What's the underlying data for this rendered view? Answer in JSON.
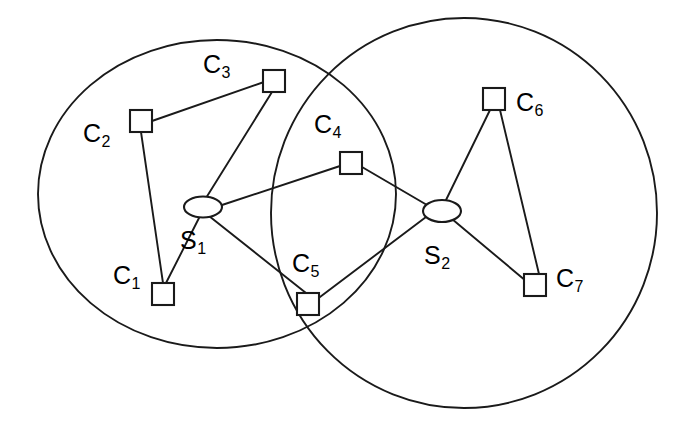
{
  "figure": {
    "background_color": "#ffffff",
    "stroke_color": "#1a1a1a",
    "width": 689,
    "height": 430
  },
  "clusters": [
    {
      "id": "cluster-1",
      "name": "left-cluster",
      "shape": "ellipse",
      "cx": 217,
      "cy": 194,
      "rx": 179,
      "ry": 154
    },
    {
      "id": "cluster-2",
      "name": "right-cluster",
      "shape": "circle",
      "cx": 464,
      "cy": 213,
      "rx": 193,
      "ry": 195
    }
  ],
  "servers": [
    {
      "id": "S1",
      "label": "S",
      "subscript": "1",
      "shape": "ellipse",
      "cx": 203,
      "cy": 207,
      "rx": 19,
      "ry": 10.5,
      "label_x": 180,
      "label_y": 228
    },
    {
      "id": "S2",
      "label": "S",
      "subscript": "2",
      "shape": "ellipse",
      "cx": 442,
      "cy": 211,
      "rx": 19,
      "ry": 11,
      "label_x": 424,
      "label_y": 243
    }
  ],
  "clients": [
    {
      "id": "C1",
      "label": "C",
      "subscript": "1",
      "shape": "square",
      "x": 152,
      "y": 283,
      "size": 22,
      "label_x": 113,
      "label_y": 263
    },
    {
      "id": "C2",
      "label": "C",
      "subscript": "2",
      "shape": "square",
      "x": 130,
      "y": 110,
      "size": 22,
      "label_x": 83,
      "label_y": 121
    },
    {
      "id": "C3",
      "label": "C",
      "subscript": "3",
      "shape": "square",
      "x": 263,
      "y": 70,
      "size": 22,
      "label_x": 203,
      "label_y": 52
    },
    {
      "id": "C4",
      "label": "C",
      "subscript": "4",
      "shape": "square",
      "x": 340,
      "y": 152,
      "size": 22,
      "label_x": 314,
      "label_y": 112
    },
    {
      "id": "C5",
      "label": "C",
      "subscript": "5",
      "shape": "square",
      "x": 297,
      "y": 293,
      "size": 22,
      "label_x": 292,
      "label_y": 251
    },
    {
      "id": "C6",
      "label": "C",
      "subscript": "6",
      "shape": "square",
      "x": 483,
      "y": 88,
      "size": 22,
      "label_x": 516,
      "label_y": 90
    },
    {
      "id": "C7",
      "label": "C",
      "subscript": "7",
      "shape": "square",
      "x": 524,
      "y": 274,
      "size": 22,
      "label_x": 556,
      "label_y": 266
    }
  ],
  "edges": [
    {
      "id": "e-C2-C3",
      "from": "C2",
      "to": "C3",
      "x1": 152,
      "y1": 121,
      "x2": 264,
      "y2": 82
    },
    {
      "id": "e-C2-C1",
      "from": "C2",
      "to": "C1",
      "x1": 141,
      "y1": 132,
      "x2": 163,
      "y2": 283
    },
    {
      "id": "e-C3-S1",
      "from": "C3",
      "to": "S1",
      "x1": 272,
      "y1": 92,
      "x2": 206,
      "y2": 198
    },
    {
      "id": "e-S1-C1",
      "from": "S1",
      "to": "C1",
      "x1": 199,
      "y1": 218,
      "x2": 166,
      "y2": 283
    },
    {
      "id": "e-S1-C4",
      "from": "S1",
      "to": "C4",
      "x1": 222,
      "y1": 205,
      "x2": 340,
      "y2": 166
    },
    {
      "id": "e-S1-C5",
      "from": "S1",
      "to": "C5",
      "x1": 209,
      "y1": 216,
      "x2": 306,
      "y2": 293
    },
    {
      "id": "e-C4-S2",
      "from": "C4",
      "to": "S2",
      "x1": 362,
      "y1": 167,
      "x2": 427,
      "y2": 205
    },
    {
      "id": "e-S2-C5",
      "from": "S2",
      "to": "C5",
      "x1": 426,
      "y1": 217,
      "x2": 316,
      "y2": 300
    },
    {
      "id": "e-S2-C6",
      "from": "S2",
      "to": "C6",
      "x1": 446,
      "y1": 200,
      "x2": 490,
      "y2": 110
    },
    {
      "id": "e-S2-C7",
      "from": "S2",
      "to": "C7",
      "x1": 452,
      "y1": 219,
      "x2": 526,
      "y2": 281
    },
    {
      "id": "e-C6-C7",
      "from": "C6",
      "to": "C7",
      "x1": 500,
      "y1": 110,
      "x2": 539,
      "y2": 274
    }
  ]
}
